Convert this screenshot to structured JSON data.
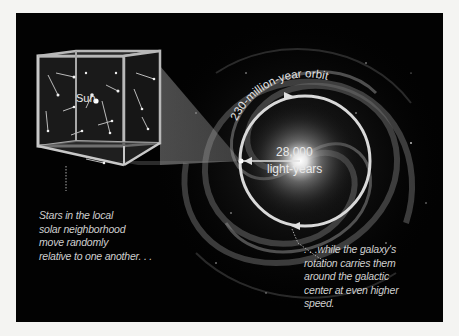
{
  "diagram": {
    "cube_label": "Sun",
    "orbit_label": "230-million-year orbit",
    "distance_value": "28,000",
    "distance_unit": "light-years",
    "caption_left": [
      "Stars in the local",
      "solar neighborhood",
      "move randomly",
      "relative to one another. . ."
    ],
    "caption_right": [
      ". . .while the galaxy's",
      "rotation carries them",
      "around the galactic",
      "center at even higher",
      "speed."
    ]
  },
  "colors": {
    "background": "#020202",
    "ring": "#d9d9d9",
    "text": "#cfcfcf",
    "page": "#f4f4f2"
  }
}
